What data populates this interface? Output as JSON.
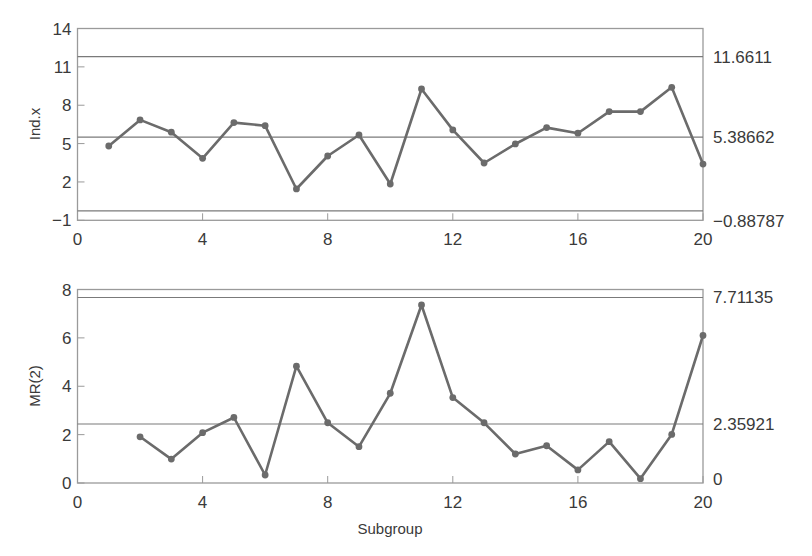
{
  "chart_data": [
    {
      "type": "line",
      "title": "",
      "ylabel": "Ind.x",
      "xlabel": "",
      "x": [
        1,
        2,
        3,
        4,
        5,
        6,
        7,
        8,
        9,
        10,
        11,
        12,
        13,
        14,
        15,
        16,
        17,
        18,
        19,
        20
      ],
      "values": [
        4.81,
        6.85,
        5.89,
        3.85,
        6.64,
        6.4,
        1.45,
        4.03,
        5.67,
        1.84,
        9.27,
        6.07,
        3.48,
        4.97,
        6.25,
        5.81,
        7.5,
        7.5,
        9.4,
        3.4
      ],
      "xlim": [
        0,
        20
      ],
      "ylim": [
        -1,
        14
      ],
      "xticks": [
        0,
        4,
        8,
        12,
        16,
        20
      ],
      "yticks": [
        -1,
        2,
        5,
        8,
        11,
        14
      ],
      "grid": false,
      "control_lines": [
        {
          "name": "UCL",
          "label": "11.6611",
          "line_y": 11.8
        },
        {
          "name": "CL",
          "label": "5.38662",
          "line_y": 5.5
        },
        {
          "name": "LCL",
          "label": "−0.88787",
          "line_y": -0.27
        }
      ]
    },
    {
      "type": "line",
      "title": "",
      "ylabel": "MR(2)",
      "xlabel": "Subgroup",
      "x": [
        2,
        3,
        4,
        5,
        6,
        7,
        8,
        9,
        10,
        11,
        12,
        13,
        14,
        15,
        16,
        17,
        18,
        19,
        20
      ],
      "values": [
        1.91,
        0.99,
        2.08,
        2.71,
        0.33,
        4.83,
        2.49,
        1.5,
        3.71,
        7.36,
        3.53,
        2.49,
        1.2,
        1.54,
        0.54,
        1.71,
        0.18,
        2.01,
        6.1
      ],
      "xlim": [
        0,
        20
      ],
      "ylim": [
        0,
        8
      ],
      "xticks": [
        0,
        4,
        8,
        12,
        16,
        20
      ],
      "yticks": [
        0,
        2,
        4,
        6,
        8
      ],
      "grid": false,
      "control_lines": [
        {
          "name": "UCL",
          "label": "7.71135",
          "line_y": 7.67
        },
        {
          "name": "CL",
          "label": "2.35921",
          "line_y": 2.44
        },
        {
          "name": "LCL",
          "label": "0",
          "line_y": 0
        }
      ]
    }
  ],
  "colors": {
    "series": "#6b6b6b",
    "control_line": "#7a7a7a",
    "frame": "#9a9a9a",
    "text": "#3a3a3a"
  }
}
